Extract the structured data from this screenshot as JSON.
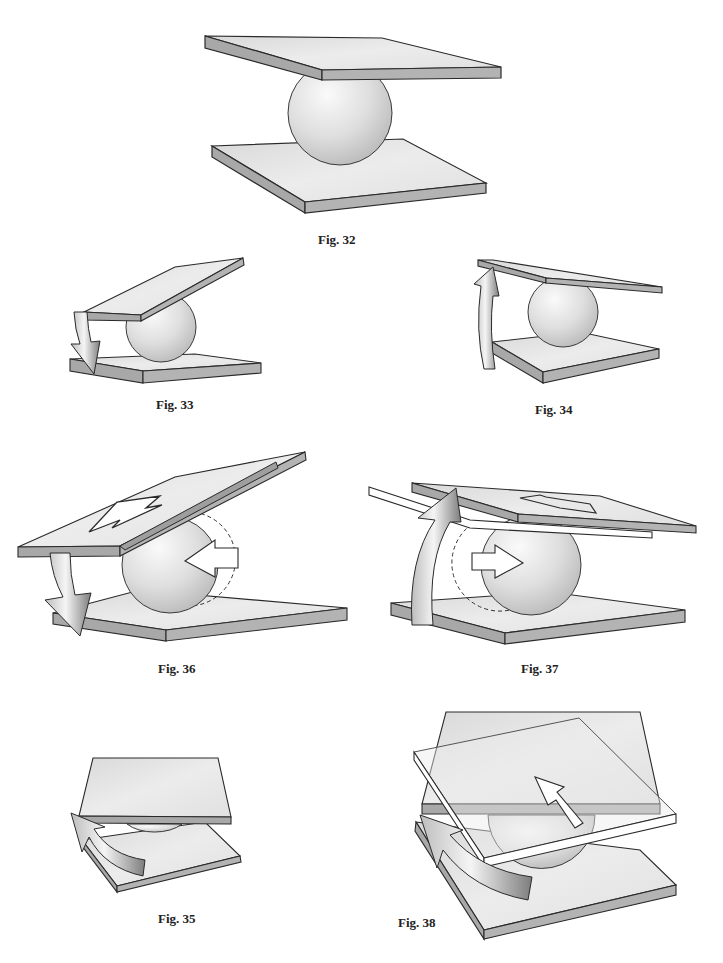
{
  "figures": [
    {
      "id": "fig32",
      "label": "Fig. 32",
      "content": "Two parallel horizontal plates with a sphere between them"
    },
    {
      "id": "fig33",
      "label": "Fig. 33",
      "content": "Top plate tilted; curved arrow pointing down on left side"
    },
    {
      "id": "fig34",
      "label": "Fig. 34",
      "content": "Top plate tilted; curved arrow pointing up on left side"
    },
    {
      "id": "fig36",
      "label": "Fig. 36",
      "content": "Top plate tilted with large flat arrow on it; downward curved arrow; sphere with left-pointing arrow and dashed previous position"
    },
    {
      "id": "fig37",
      "label": "Fig. 37",
      "content": "Top plate tilted up with upward curved arrow; sphere with right-pointing arrow and dashed previous position"
    },
    {
      "id": "fig35",
      "label": "Fig. 35",
      "content": "Top plate rotated relative to bottom plate; curved rotation arrow on left"
    },
    {
      "id": "fig38",
      "label": "Fig. 38",
      "content": "Top plate rotated with transparent outline of new position; diagonal arrow and curved rotation arrow"
    }
  ],
  "colors": {
    "plate_top": "#e4e4e4",
    "plate_edge": "#a9a9a9",
    "outline": "#2a2a2a",
    "sphere_light": "#f6f6f6",
    "sphere_dark": "#bdbdbd",
    "arrow_light": "#f2f2f2",
    "arrow_dark": "#8c8c8c"
  }
}
